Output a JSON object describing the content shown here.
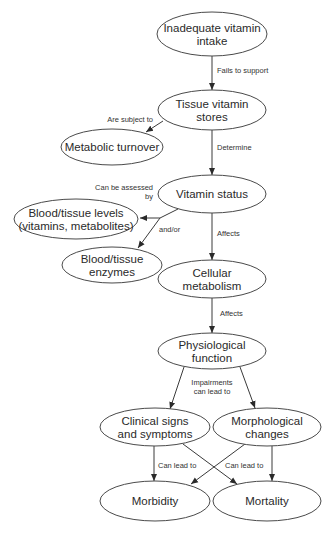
{
  "diagram": {
    "type": "flowchart",
    "colors": {
      "stroke": "#4a4a4a",
      "text": "#2a2a2a",
      "edge": "#3a3a3a",
      "background": "#ffffff"
    },
    "nodes": [
      {
        "id": "intake",
        "lines": [
          "Inadequate vitamin",
          "intake"
        ],
        "cx": 212,
        "cy": 34,
        "rx": 55,
        "ry": 22
      },
      {
        "id": "stores",
        "lines": [
          "Tissue vitamin",
          "stores"
        ],
        "cx": 212,
        "cy": 110,
        "rx": 54,
        "ry": 20
      },
      {
        "id": "turnover",
        "lines": [
          "Metabolic turnover"
        ],
        "cx": 112,
        "cy": 147,
        "rx": 51,
        "ry": 18
      },
      {
        "id": "status",
        "lines": [
          "Vitamin status"
        ],
        "cx": 212,
        "cy": 194,
        "rx": 54,
        "ry": 19
      },
      {
        "id": "levels",
        "lines": [
          "Blood/tissue levels",
          "(vitamins, metabolites)"
        ],
        "cx": 76,
        "cy": 219,
        "rx": 62,
        "ry": 20
      },
      {
        "id": "enzymes",
        "lines": [
          "Blood/tissue",
          "enzymes"
        ],
        "cx": 112,
        "cy": 265,
        "rx": 50,
        "ry": 18
      },
      {
        "id": "cellular",
        "lines": [
          "Cellular",
          "metabolism"
        ],
        "cx": 212,
        "cy": 279,
        "rx": 54,
        "ry": 19
      },
      {
        "id": "physio",
        "lines": [
          "Physiological",
          "function"
        ],
        "cx": 212,
        "cy": 351,
        "rx": 54,
        "ry": 18
      },
      {
        "id": "clinical",
        "lines": [
          "Clinical signs",
          "and symptoms"
        ],
        "cx": 155,
        "cy": 427,
        "rx": 55,
        "ry": 19
      },
      {
        "id": "morpho",
        "lines": [
          "Morphological",
          "changes"
        ],
        "cx": 267,
        "cy": 427,
        "rx": 54,
        "ry": 19
      },
      {
        "id": "morbidity",
        "lines": [
          "Morbidity"
        ],
        "cx": 155,
        "cy": 501,
        "rx": 55,
        "ry": 20
      },
      {
        "id": "mortality",
        "lines": [
          "Mortality"
        ],
        "cx": 267,
        "cy": 501,
        "rx": 54,
        "ry": 20
      }
    ],
    "edges": [
      {
        "from": "intake",
        "to": "stores",
        "points": [
          [
            212,
            56
          ],
          [
            212,
            90
          ]
        ],
        "arrow": true
      },
      {
        "from": "stores",
        "to": "turnover",
        "points": [
          [
            163,
            121
          ],
          [
            146,
            132
          ]
        ],
        "arrow": true
      },
      {
        "from": "stores",
        "to": "status",
        "points": [
          [
            212,
            130
          ],
          [
            212,
            175
          ]
        ],
        "arrow": true
      },
      {
        "from": "status",
        "to": "junction",
        "points": [
          [
            178,
            209
          ],
          [
            160,
            218
          ]
        ],
        "arrow": false
      },
      {
        "from": "junction",
        "to": "levels",
        "points": [
          [
            160,
            218
          ],
          [
            140,
            218
          ]
        ],
        "arrow": true
      },
      {
        "from": "junction",
        "to": "enzymes",
        "points": [
          [
            160,
            218
          ],
          [
            138,
            248
          ]
        ],
        "arrow": true
      },
      {
        "from": "status",
        "to": "cellular",
        "points": [
          [
            212,
            213
          ],
          [
            212,
            260
          ]
        ],
        "arrow": true
      },
      {
        "from": "cellular",
        "to": "physio",
        "points": [
          [
            212,
            298
          ],
          [
            212,
            333
          ]
        ],
        "arrow": true
      },
      {
        "from": "physio",
        "to": "clinical",
        "points": [
          [
            184,
            367
          ],
          [
            170,
            409
          ]
        ],
        "arrow": true
      },
      {
        "from": "physio",
        "to": "morpho",
        "points": [
          [
            240,
            367
          ],
          [
            255,
            408
          ]
        ],
        "arrow": true
      },
      {
        "from": "clinical",
        "to": "morbidity",
        "points": [
          [
            154,
            446
          ],
          [
            154,
            481
          ]
        ],
        "arrow": true
      },
      {
        "from": "clinical",
        "to": "mortality",
        "points": [
          [
            183,
            444
          ],
          [
            237,
            484
          ]
        ],
        "arrow": true
      },
      {
        "from": "morpho",
        "to": "morbidity",
        "points": [
          [
            245,
            444
          ],
          [
            191,
            484
          ]
        ],
        "arrow": true
      },
      {
        "from": "morpho",
        "to": "mortality",
        "points": [
          [
            272,
            446
          ],
          [
            272,
            481
          ]
        ],
        "arrow": true
      }
    ],
    "labels": [
      {
        "id": "fails-to-support",
        "lines": [
          "Fails to support"
        ],
        "x": 217,
        "y": 73,
        "anchor": "start"
      },
      {
        "id": "are-subject-to",
        "lines": [
          "Are subject to"
        ],
        "x": 153,
        "y": 122,
        "anchor": "end"
      },
      {
        "id": "determine",
        "lines": [
          "Determine"
        ],
        "x": 217,
        "y": 150,
        "anchor": "start"
      },
      {
        "id": "can-be-assessed-by",
        "lines": [
          "Can be assessed",
          "by"
        ],
        "x": 153,
        "y": 190,
        "anchor": "end"
      },
      {
        "id": "and-or",
        "lines": [
          "and/or"
        ],
        "x": 159,
        "y": 232,
        "anchor": "start"
      },
      {
        "id": "affects-1",
        "lines": [
          "Affects"
        ],
        "x": 217,
        "y": 236,
        "anchor": "start"
      },
      {
        "id": "affects-2",
        "lines": [
          "Affects"
        ],
        "x": 220,
        "y": 316,
        "anchor": "start"
      },
      {
        "id": "impairments",
        "lines": [
          "Impairments",
          "can lead to"
        ],
        "x": 212,
        "y": 385,
        "anchor": "middle"
      },
      {
        "id": "can-lead-to-1",
        "lines": [
          "Can lead to"
        ],
        "x": 158,
        "y": 468,
        "anchor": "start"
      },
      {
        "id": "can-lead-to-2",
        "lines": [
          "Can lead to"
        ],
        "x": 225,
        "y": 468,
        "anchor": "start"
      }
    ]
  }
}
